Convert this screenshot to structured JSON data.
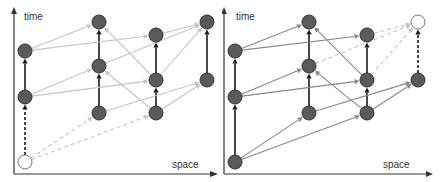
{
  "colors": {
    "node_fill": "#5a5a5a",
    "node_stroke": "#333333",
    "open_node_fill": "#ffffff",
    "vertical_edge": "#1a1a1a",
    "left_edge": "#c4c4c4",
    "right_edge": "#888888",
    "dashed_light": "#c4c4c4",
    "axis": "#333333"
  },
  "panels": [
    {
      "id": "left",
      "axis": {
        "y_label": "time",
        "x_label": "space"
      },
      "nodes": [
        {
          "id": "A0",
          "x": 25,
          "y": 162,
          "open": true
        },
        {
          "id": "A2",
          "x": 25,
          "y": 97
        },
        {
          "id": "A1",
          "x": 25,
          "y": 51
        },
        {
          "id": "B3",
          "x": 99,
          "y": 113
        },
        {
          "id": "B2",
          "x": 99,
          "y": 66
        },
        {
          "id": "B1",
          "x": 99,
          "y": 22
        },
        {
          "id": "C3",
          "x": 156,
          "y": 113
        },
        {
          "id": "C2",
          "x": 156,
          "y": 80
        },
        {
          "id": "C1",
          "x": 156,
          "y": 35
        },
        {
          "id": "D2",
          "x": 207,
          "y": 80
        },
        {
          "id": "D1",
          "x": 207,
          "y": 22
        }
      ],
      "edges": [
        {
          "from": "A0",
          "to": "A2",
          "style": "vertical-dashed"
        },
        {
          "from": "A2",
          "to": "A1",
          "style": "vertical"
        },
        {
          "from": "B3",
          "to": "B2",
          "style": "vertical"
        },
        {
          "from": "B2",
          "to": "B1",
          "style": "vertical"
        },
        {
          "from": "C3",
          "to": "C2",
          "style": "vertical"
        },
        {
          "from": "C2",
          "to": "C1",
          "style": "vertical"
        },
        {
          "from": "D2",
          "to": "D1",
          "style": "vertical"
        },
        {
          "from": "A1",
          "to": "B1",
          "style": "light"
        },
        {
          "from": "A1",
          "to": "C1",
          "style": "light"
        },
        {
          "from": "A2",
          "to": "B2",
          "style": "light"
        },
        {
          "from": "A2",
          "to": "C2",
          "style": "light"
        },
        {
          "from": "C2",
          "to": "B1",
          "style": "light"
        },
        {
          "from": "C3",
          "to": "B2",
          "style": "light"
        },
        {
          "from": "B2",
          "to": "D1",
          "style": "light"
        },
        {
          "from": "C1",
          "to": "D1",
          "style": "light"
        },
        {
          "from": "C2",
          "to": "D1",
          "style": "light"
        },
        {
          "from": "B3",
          "to": "D2",
          "style": "light"
        },
        {
          "from": "C3",
          "to": "D2",
          "style": "light"
        },
        {
          "from": "A0",
          "to": "B3",
          "style": "light-dashed"
        },
        {
          "from": "A0",
          "to": "C3",
          "style": "light-dashed"
        }
      ]
    },
    {
      "id": "right",
      "axis": {
        "y_label": "time",
        "x_label": "space"
      },
      "nodes": [
        {
          "id": "A0",
          "x": 13,
          "y": 162
        },
        {
          "id": "A2",
          "x": 13,
          "y": 97
        },
        {
          "id": "A1",
          "x": 13,
          "y": 51
        },
        {
          "id": "B3",
          "x": 87,
          "y": 113
        },
        {
          "id": "B2",
          "x": 87,
          "y": 66
        },
        {
          "id": "B1",
          "x": 87,
          "y": 22
        },
        {
          "id": "C3",
          "x": 145,
          "y": 113
        },
        {
          "id": "C2",
          "x": 145,
          "y": 80
        },
        {
          "id": "C1",
          "x": 145,
          "y": 35
        },
        {
          "id": "D2",
          "x": 196,
          "y": 80
        },
        {
          "id": "D1",
          "x": 196,
          "y": 22,
          "open": true
        }
      ],
      "edges": [
        {
          "from": "A0",
          "to": "A2",
          "style": "vertical"
        },
        {
          "from": "A2",
          "to": "A1",
          "style": "vertical"
        },
        {
          "from": "B3",
          "to": "B2",
          "style": "vertical"
        },
        {
          "from": "B2",
          "to": "B1",
          "style": "vertical"
        },
        {
          "from": "C3",
          "to": "C2",
          "style": "vertical"
        },
        {
          "from": "C2",
          "to": "C1",
          "style": "vertical"
        },
        {
          "from": "D2",
          "to": "D1",
          "style": "vertical-dashed"
        },
        {
          "from": "A1",
          "to": "B1",
          "style": "medium"
        },
        {
          "from": "A1",
          "to": "C1",
          "style": "medium"
        },
        {
          "from": "A2",
          "to": "B2",
          "style": "medium"
        },
        {
          "from": "A2",
          "to": "C2",
          "style": "medium"
        },
        {
          "from": "C2",
          "to": "B1",
          "style": "medium"
        },
        {
          "from": "C3",
          "to": "B2",
          "style": "medium"
        },
        {
          "from": "B3",
          "to": "D2",
          "style": "medium"
        },
        {
          "from": "C3",
          "to": "D2",
          "style": "medium"
        },
        {
          "from": "A0",
          "to": "B3",
          "style": "medium"
        },
        {
          "from": "A0",
          "to": "C3",
          "style": "medium"
        },
        {
          "from": "B2",
          "to": "D1",
          "style": "light-dashed"
        },
        {
          "from": "C1",
          "to": "D1",
          "style": "light-dashed"
        },
        {
          "from": "C2",
          "to": "D1",
          "style": "light-dashed"
        }
      ]
    }
  ]
}
